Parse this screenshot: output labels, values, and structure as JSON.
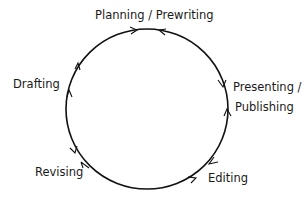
{
  "diagram": {
    "stages": [
      {
        "id": "planning",
        "label": "Planning / Prewriting"
      },
      {
        "id": "drafting",
        "label": "Drafting"
      },
      {
        "id": "revising",
        "label": "Revising"
      },
      {
        "id": "editing",
        "label": "Editing"
      },
      {
        "id": "presenting",
        "label_line1": "Presenting /",
        "label_line2": "Publishing"
      }
    ],
    "colors": {
      "stroke": "#111111",
      "text": "#1a1a1a",
      "background": "#ffffff"
    }
  }
}
